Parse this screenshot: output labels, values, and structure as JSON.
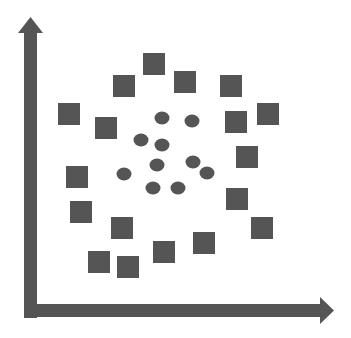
{
  "diagram": {
    "title": "",
    "colors": {
      "background": "#ffffff",
      "shape_fill": "#555555",
      "axis": "#555555"
    },
    "axes": {
      "x_axis": {
        "label": "",
        "arrow": "right"
      },
      "y_axis": {
        "label": "",
        "arrow": "up"
      }
    },
    "legend": []
  },
  "chart_data": {
    "type": "scatter",
    "title": "",
    "xlabel": "",
    "ylabel": "",
    "grid": false,
    "series": [
      {
        "name": "squares",
        "marker": "square",
        "points_px": [
          [
            154,
            64
          ],
          [
            124,
            86
          ],
          [
            185,
            82
          ],
          [
            231,
            86
          ],
          [
            69,
            114
          ],
          [
            106,
            128
          ],
          [
            236,
            122
          ],
          [
            268,
            114
          ],
          [
            247,
            157
          ],
          [
            77,
            177
          ],
          [
            81,
            212
          ],
          [
            237,
            199
          ],
          [
            122,
            228
          ],
          [
            262,
            228
          ],
          [
            204,
            243
          ],
          [
            164,
            252
          ],
          [
            99,
            262
          ],
          [
            128,
            267
          ]
        ]
      },
      {
        "name": "circles",
        "marker": "circle",
        "points_px": [
          [
            162,
            118
          ],
          [
            192,
            121
          ],
          [
            141,
            140
          ],
          [
            162,
            145
          ],
          [
            124,
            174
          ],
          [
            157,
            165
          ],
          [
            193,
            162
          ],
          [
            207,
            173
          ],
          [
            153,
            188
          ],
          [
            178,
            188
          ]
        ]
      }
    ]
  }
}
